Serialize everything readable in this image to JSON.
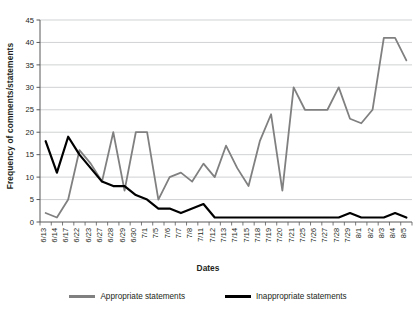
{
  "chart_data": {
    "type": "line",
    "title": "",
    "xlabel": "Dates",
    "ylabel": "Frequency of comments/statements",
    "ylim": [
      0,
      45
    ],
    "ytick_step": 5,
    "yticks": [
      0,
      5,
      10,
      15,
      20,
      25,
      30,
      35,
      40,
      45
    ],
    "grid": true,
    "legend_position": "bottom",
    "categories": [
      "6/13",
      "6/14",
      "6/17",
      "6/22",
      "6/23",
      "6/27",
      "6/28",
      "6/29",
      "6/30",
      "7/1",
      "7/5",
      "7/6",
      "7/7",
      "7/8",
      "7/11",
      "7/12",
      "7/13",
      "7/14",
      "7/15",
      "7/18",
      "7/19",
      "7/20",
      "7/21",
      "7/25",
      "7/26",
      "7/27",
      "7/28",
      "7/29",
      "8/1",
      "8/2",
      "8/3",
      "8/4",
      "8/5"
    ],
    "series": [
      {
        "name": "Appropriate statements",
        "color": "#808080",
        "values": [
          2,
          1,
          5,
          16,
          13,
          9,
          20,
          7,
          20,
          20,
          5,
          10,
          11,
          9,
          13,
          10,
          17,
          12,
          8,
          18,
          24,
          7,
          30,
          25,
          25,
          25,
          30,
          23,
          22,
          25,
          41,
          41,
          36
        ]
      },
      {
        "name": "Inappropriate statements",
        "color": "#000000",
        "values": [
          18,
          11,
          19,
          15,
          12,
          9,
          8,
          8,
          6,
          5,
          3,
          3,
          2,
          3,
          4,
          1,
          1,
          1,
          1,
          1,
          1,
          1,
          1,
          1,
          1,
          1,
          1,
          2,
          1,
          1,
          1,
          2,
          1
        ]
      }
    ]
  },
  "legend": {
    "items": [
      {
        "label": "Appropriate statements",
        "color": "#808080"
      },
      {
        "label": "Inappropriate statements",
        "color": "#000000"
      }
    ]
  },
  "axes": {
    "y_title": "Frequency of comments/statements",
    "x_title": "Dates"
  }
}
